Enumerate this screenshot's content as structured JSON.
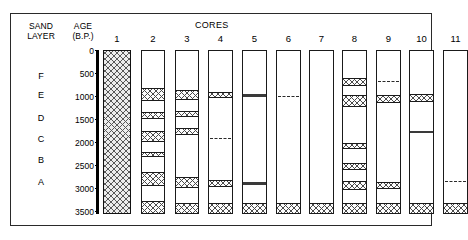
{
  "figure": {
    "headings": {
      "sand_layer": "SAND\nLAYER",
      "age": "AGE\n(B.P.)",
      "cores": "CORES"
    },
    "sand_layers": [
      {
        "letter": "F",
        "top_px": 71
      },
      {
        "letter": "E",
        "top_px": 90
      },
      {
        "letter": "D",
        "top_px": 113
      },
      {
        "letter": "C",
        "top_px": 134
      },
      {
        "letter": "B",
        "top_px": 155
      },
      {
        "letter": "A",
        "top_px": 177
      }
    ],
    "age_axis": {
      "unit": "B.P.",
      "min": 0,
      "max": 3500,
      "ticks": [
        {
          "label": "0",
          "value": 0,
          "top_px": 46
        },
        {
          "label": "500",
          "value": 500,
          "top_px": 69
        },
        {
          "label": "1000",
          "value": 1000,
          "top_px": 92
        },
        {
          "label": "1500",
          "value": 1500,
          "top_px": 115
        },
        {
          "label": "2000",
          "value": 2000,
          "top_px": 138
        },
        {
          "label": "2500",
          "value": 2500,
          "top_px": 161
        },
        {
          "label": "3000",
          "value": 3000,
          "top_px": 184
        },
        {
          "label": "3500",
          "value": 3500,
          "top_px": 207
        }
      ]
    },
    "cores": [
      {
        "number": "1",
        "left_px": 103,
        "width_px": 28,
        "full_hatch": true,
        "bands": []
      },
      {
        "number": "2",
        "left_px": 141,
        "width_px": 24,
        "full_hatch": false,
        "bands": [
          {
            "style": "hatch",
            "top_px": 37,
            "height_px": 13
          },
          {
            "style": "hatch",
            "top_px": 61,
            "height_px": 7
          },
          {
            "style": "hatch",
            "top_px": 80,
            "height_px": 11
          },
          {
            "style": "hatch",
            "top_px": 101,
            "height_px": 5
          },
          {
            "style": "hatch",
            "top_px": 121,
            "height_px": 14
          },
          {
            "style": "hatch",
            "top_px": 150,
            "height_px": 14
          }
        ]
      },
      {
        "number": "3",
        "left_px": 175,
        "width_px": 24,
        "full_hatch": false,
        "bands": [
          {
            "style": "hatch",
            "top_px": 39,
            "height_px": 10
          },
          {
            "style": "hatch",
            "top_px": 60,
            "height_px": 6
          },
          {
            "style": "hatch",
            "top_px": 77,
            "height_px": 7
          },
          {
            "style": "hatch",
            "top_px": 126,
            "height_px": 11
          },
          {
            "style": "hatch",
            "top_px": 152,
            "height_px": 12
          }
        ]
      },
      {
        "number": "4",
        "left_px": 208,
        "width_px": 25,
        "full_hatch": false,
        "bands": [
          {
            "style": "hatch",
            "top_px": 41,
            "height_px": 6
          },
          {
            "style": "dashed-line",
            "top_px": 85,
            "height_px": 3
          },
          {
            "style": "hatch",
            "top_px": 129,
            "height_px": 7
          },
          {
            "style": "hatch",
            "top_px": 152,
            "height_px": 12
          }
        ]
      },
      {
        "number": "5",
        "left_px": 242,
        "width_px": 25,
        "full_hatch": false,
        "bands": [
          {
            "style": "solid",
            "top_px": 43,
            "height_px": 3
          },
          {
            "style": "solid",
            "top_px": 131,
            "height_px": 3
          },
          {
            "style": "hatch",
            "top_px": 152,
            "height_px": 12
          }
        ]
      },
      {
        "number": "6",
        "left_px": 276,
        "width_px": 25,
        "full_hatch": false,
        "bands": [
          {
            "style": "dashed-line",
            "top_px": 43,
            "height_px": 3
          },
          {
            "style": "hatch",
            "top_px": 152,
            "height_px": 12
          }
        ]
      },
      {
        "number": "7",
        "left_px": 309,
        "width_px": 25,
        "full_hatch": false,
        "bands": [
          {
            "style": "hatch",
            "top_px": 152,
            "height_px": 12
          }
        ]
      },
      {
        "number": "8",
        "left_px": 342,
        "width_px": 25,
        "full_hatch": false,
        "bands": [
          {
            "style": "hatch",
            "top_px": 27,
            "height_px": 8
          },
          {
            "style": "hatch",
            "top_px": 44,
            "height_px": 12
          },
          {
            "style": "hatch",
            "top_px": 92,
            "height_px": 6
          },
          {
            "style": "hatch",
            "top_px": 112,
            "height_px": 7
          },
          {
            "style": "hatch",
            "top_px": 130,
            "height_px": 9
          },
          {
            "style": "hatch",
            "top_px": 152,
            "height_px": 12
          }
        ]
      },
      {
        "number": "9",
        "left_px": 376,
        "width_px": 25,
        "full_hatch": false,
        "bands": [
          {
            "style": "dashed-line",
            "top_px": 28,
            "height_px": 3
          },
          {
            "style": "hatch",
            "top_px": 44,
            "height_px": 8
          },
          {
            "style": "hatch",
            "top_px": 131,
            "height_px": 7
          },
          {
            "style": "hatch",
            "top_px": 152,
            "height_px": 12
          }
        ]
      },
      {
        "number": "10",
        "left_px": 409,
        "width_px": 25,
        "full_hatch": false,
        "bands": [
          {
            "style": "hatch",
            "top_px": 43,
            "height_px": 8
          },
          {
            "style": "solid",
            "top_px": 80,
            "height_px": 2
          },
          {
            "style": "hatch",
            "top_px": 152,
            "height_px": 12
          }
        ]
      },
      {
        "number": "11",
        "left_px": 443,
        "width_px": 25,
        "full_hatch": false,
        "bands": [
          {
            "style": "dashed-line",
            "top_px": 128,
            "height_px": 3
          },
          {
            "style": "hatch",
            "top_px": 152,
            "height_px": 12
          }
        ]
      }
    ]
  }
}
